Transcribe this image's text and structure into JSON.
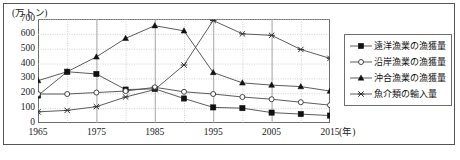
{
  "figure": {
    "y_axis_unit_label": "(万トン)",
    "x_axis_unit_label": "(年)",
    "bottom_note": ""
  },
  "legend": {
    "items": [
      {
        "label": "遠洋漁業の漁獲量",
        "marker": "filled-square-marker",
        "color": "#1a1a1a"
      },
      {
        "label": "沿岸漁業の漁獲量",
        "marker": "open-circle-marker",
        "color": "#1a1a1a"
      },
      {
        "label": "沖合漁業の漁獲量",
        "marker": "filled-triangle-marker",
        "color": "#1a1a1a"
      },
      {
        "label": "魚介類の輸入量",
        "marker": "x-cross-marker",
        "color": "#1a1a1a"
      }
    ]
  },
  "chart_data": {
    "type": "line",
    "title": "",
    "xlabel": "(年)",
    "ylabel": "(万トン)",
    "xlim": [
      1965,
      2015
    ],
    "ylim": [
      0,
      700
    ],
    "grid": true,
    "legend_position": "right-outside",
    "x": [
      1965,
      1970,
      1975,
      1980,
      1985,
      1990,
      1995,
      2000,
      2005,
      2010,
      2015
    ],
    "x_tick_labels": [
      "1965",
      "1975",
      "1985",
      "1995",
      "2005",
      "2015"
    ],
    "x_tick_values": [
      1965,
      1975,
      1985,
      1995,
      2005,
      2015
    ],
    "y_tick_labels": [
      "0",
      "100",
      "200",
      "300",
      "400",
      "500",
      "600",
      "700"
    ],
    "y_tick_values": [
      0,
      100,
      200,
      300,
      400,
      500,
      600,
      700
    ],
    "series": [
      {
        "name": "遠洋漁業の漁獲量",
        "marker": "filled-square-marker",
        "values": [
          185,
          345,
          330,
          225,
          230,
          165,
          105,
          100,
          70,
          60,
          50
        ]
      },
      {
        "name": "沿岸漁業の漁獲量",
        "marker": "open-circle-marker",
        "values": [
          195,
          195,
          205,
          215,
          240,
          210,
          195,
          175,
          160,
          140,
          120
        ]
      },
      {
        "name": "沖合漁業の漁獲量",
        "marker": "filled-triangle-marker",
        "values": [
          285,
          345,
          445,
          570,
          655,
          620,
          340,
          270,
          255,
          245,
          215
        ]
      },
      {
        "name": "魚介類の輸入量",
        "marker": "x-cross-marker",
        "values": [
          75,
          85,
          110,
          175,
          225,
          390,
          690,
          600,
          590,
          495,
          435
        ]
      }
    ]
  }
}
